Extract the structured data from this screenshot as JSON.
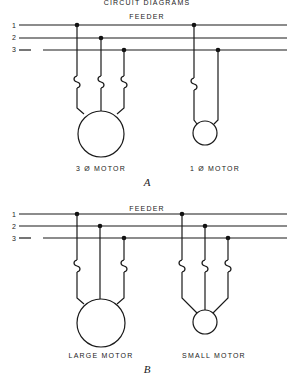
{
  "header": {
    "caption": "CIRCUIT DIAGRAMS"
  },
  "diagrams": [
    {
      "id": "A",
      "label": "A",
      "feeder_label": "FEEDER",
      "line_numbers": [
        "1",
        "2",
        "3"
      ],
      "motors": [
        {
          "label": "3 Ø MOTOR",
          "type": "three-phase",
          "fused_lines": 3
        },
        {
          "label": "1 Ø MOTOR",
          "type": "single-phase",
          "fused_lines": 1
        }
      ]
    },
    {
      "id": "B",
      "label": "B",
      "feeder_label": "FEEDER",
      "line_numbers": [
        "1",
        "2",
        "3"
      ],
      "motors": [
        {
          "label": "LARGE MOTOR",
          "type": "three-phase",
          "fused_lines": 2
        },
        {
          "label": "SMALL MOTOR",
          "type": "three-phase",
          "fused_lines": 3
        }
      ]
    }
  ],
  "colors": {
    "line": "#1a1a1a",
    "background": "#ffffff"
  }
}
